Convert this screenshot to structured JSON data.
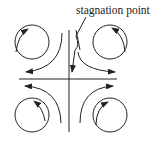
{
  "diagram": {
    "label": "stagnation point",
    "colors": {
      "stroke": "#222222",
      "background": "#ffffff"
    }
  }
}
